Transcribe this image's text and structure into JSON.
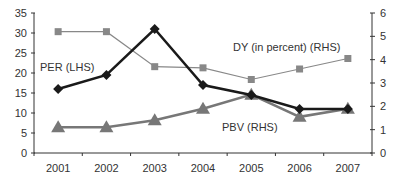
{
  "chart_data": {
    "type": "line",
    "title": "",
    "xlabel": "",
    "ylabel": "",
    "categories": [
      "2001",
      "2002",
      "2003",
      "2004",
      "2005",
      "2006",
      "2007"
    ],
    "left_axis": {
      "range": [
        0,
        35
      ],
      "ticks": [
        "0",
        "5",
        "10",
        "15",
        "20",
        "25",
        "30",
        "35"
      ]
    },
    "right_axis": {
      "range": [
        0,
        6
      ],
      "ticks": [
        "0",
        "1",
        "2",
        "3",
        "4",
        "5",
        "6"
      ]
    },
    "grid": false,
    "legend_position": "inline annotations",
    "series": [
      {
        "name": "PER (LHS)",
        "axis": "left",
        "marker": "diamond",
        "color": "#1a1a1a",
        "values": [
          16,
          19.5,
          31,
          17,
          14.5,
          11,
          11
        ]
      },
      {
        "name": "DY (in percent) (RHS)",
        "axis": "right",
        "marker": "square",
        "color": "#888888",
        "values": [
          5.2,
          5.2,
          3.7,
          3.65,
          3.15,
          3.6,
          4.05
        ]
      },
      {
        "name": "PBV (RHS)",
        "axis": "right",
        "marker": "triangle",
        "color": "#777777",
        "values": [
          1.1,
          1.1,
          1.4,
          1.9,
          2.5,
          1.55,
          1.9
        ]
      }
    ],
    "annotations": [
      {
        "text": "PER (LHS)"
      },
      {
        "text": "DY (in percent) (RHS)"
      },
      {
        "text": "PBV (RHS)"
      }
    ]
  }
}
